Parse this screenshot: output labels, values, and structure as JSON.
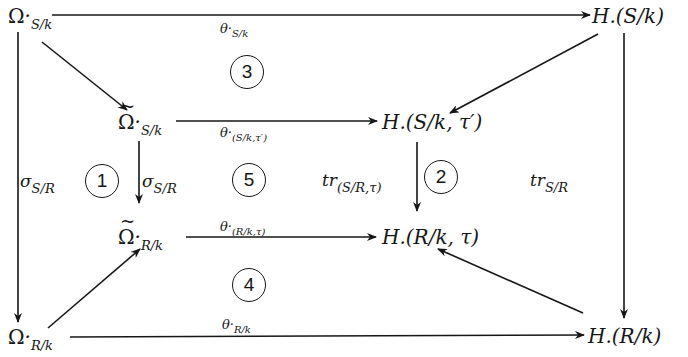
{
  "diagram": {
    "type": "commutative-diagram",
    "nodes": {
      "omega_S_k": {
        "base": "Ω",
        "dot": "·",
        "sub": "S/k"
      },
      "omega_tilde_S_k": {
        "base": "Ω",
        "dot": "·",
        "sub": "S/k",
        "tilde": true
      },
      "omega_tilde_R_k": {
        "base": "Ω",
        "dot": "·",
        "sub": "R/k",
        "tilde": true
      },
      "omega_R_k": {
        "base": "Ω",
        "dot": "·",
        "sub": "R/k"
      },
      "H_S_k": {
        "text": "H.(S/k)"
      },
      "H_S_k_tau_prime": {
        "text": "H.(S/k, τ′)"
      },
      "H_R_k_tau": {
        "text": "H.(R/k, τ)"
      },
      "H_R_k": {
        "text": "H.(R/k)"
      }
    },
    "labels": {
      "theta_S_k": {
        "base": "θ·",
        "sub": "S/k"
      },
      "theta_S_k_tau_prime": {
        "base": "θ·",
        "sub": "(S/k,τ′)"
      },
      "theta_R_k_tau": {
        "base": "θ·",
        "sub": "(R/k,τ)"
      },
      "theta_R_k": {
        "base": "θ·",
        "sub": "R/k"
      },
      "sigma_outer": {
        "base": "σ",
        "sub": "S/R"
      },
      "sigma_inner": {
        "base": "σ",
        "sub": "S/R"
      },
      "tr_inner": {
        "base": "tr",
        "sub": "(S/R,τ)"
      },
      "tr_outer": {
        "base": "tr",
        "sub": "S/R"
      }
    },
    "regions": [
      "1",
      "2",
      "3",
      "4",
      "5"
    ],
    "edges": [
      {
        "from": "omega_S_k",
        "to": "H_S_k",
        "label": "theta_S_k"
      },
      {
        "from": "omega_S_k",
        "to": "omega_tilde_S_k"
      },
      {
        "from": "omega_S_k",
        "to": "omega_R_k",
        "label": "sigma_outer"
      },
      {
        "from": "H_S_k",
        "to": "H_S_k_tau_prime"
      },
      {
        "from": "H_S_k",
        "to": "H_R_k",
        "label": "tr_outer"
      },
      {
        "from": "omega_tilde_S_k",
        "to": "H_S_k_tau_prime",
        "label": "theta_S_k_tau_prime"
      },
      {
        "from": "omega_tilde_S_k",
        "to": "omega_tilde_R_k",
        "label": "sigma_inner"
      },
      {
        "from": "H_S_k_tau_prime",
        "to": "H_R_k_tau",
        "label": "tr_inner"
      },
      {
        "from": "omega_tilde_R_k",
        "to": "H_R_k_tau",
        "label": "theta_R_k_tau"
      },
      {
        "from": "omega_R_k",
        "to": "omega_tilde_R_k"
      },
      {
        "from": "H_R_k",
        "to": "H_R_k_tau"
      },
      {
        "from": "omega_R_k",
        "to": "H_R_k",
        "label": "theta_R_k"
      }
    ]
  }
}
